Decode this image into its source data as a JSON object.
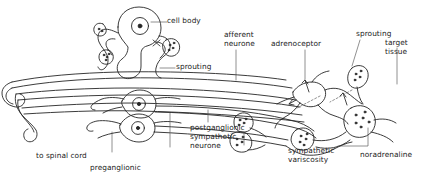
{
  "figure": {
    "background_color": "#ffffff",
    "ink_color": "#262626",
    "label_color": "#222222",
    "width": 438,
    "height": 183
  },
  "labels": {
    "cell_body": "cell body",
    "sprouting_left": "sprouting",
    "afferent_neurone_line1": "afferent",
    "afferent_neurone_line2": "neurone",
    "adrenoceptor": "adrenoceptor",
    "sprouting_right": "sprouting",
    "target_tissue_line1": "target",
    "target_tissue_line2": "tissue",
    "to_spinal_cord": "to spinal cord",
    "preganglionic": "preganglionic",
    "postganglionic_line1": "postganglionic",
    "postganglionic_line2": "sympathetic",
    "postganglionic_line3": "neurone",
    "sympathetic_varicosity_line1": "sympathetic",
    "sympathetic_varicosity_line2": "variscosity",
    "noradrenaline": "noradrenaline"
  },
  "structures": [
    {
      "name": "sensory-cell-body",
      "description": "large round afferent cell body with central nucleus"
    },
    {
      "name": "sprouting-branch-left",
      "description": "sprouting nerve terminal with vesicle cluster"
    },
    {
      "name": "ganglion-neurone-upper",
      "description": "postganglionic sympathetic neurone soma with nucleus"
    },
    {
      "name": "ganglion-neurone-lower",
      "description": "postganglionic sympathetic neurone soma with nucleus"
    },
    {
      "name": "preganglionic-fibre",
      "description": "preganglionic axon running from spinal cord"
    },
    {
      "name": "afferent-fibre",
      "description": "afferent axon running to spinal cord"
    },
    {
      "name": "blood-vessel",
      "description": "target blood vessel wall receiving adrenoceptor input"
    },
    {
      "name": "varicosity-bead",
      "description": "sympathetic varicosity containing noradrenaline vesicles"
    },
    {
      "name": "adrenoceptor-arrow",
      "description": "arrow marking adrenoceptor on vessel wall"
    }
  ]
}
